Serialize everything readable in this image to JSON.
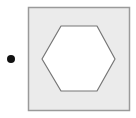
{
  "figure": {
    "background": "#ffffff",
    "bullet": {
      "cx": 11,
      "cy": 59,
      "r": 4,
      "color": "#111111"
    },
    "square": {
      "x": 28.5,
      "y": 7.5,
      "width": 101,
      "height": 103,
      "fill": "#ebebeb",
      "stroke": "#9a9a9a",
      "stroke_width": 1.5
    },
    "hexagon": {
      "points": "61,26 97,26 115,59 97,91 61,91 42,59",
      "fill": "#ffffff",
      "stroke": "#777777",
      "stroke_width": 1.2
    }
  }
}
